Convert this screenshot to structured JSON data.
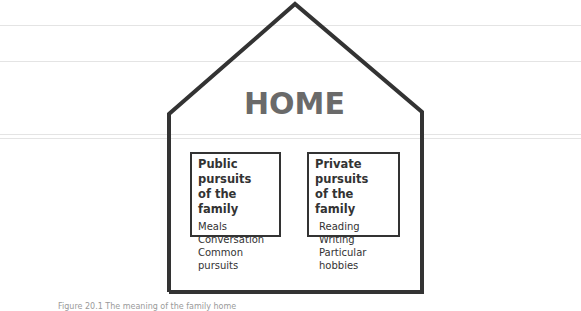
{
  "diagram": {
    "title": "HOME",
    "boxes": [
      {
        "heading_line1": "Public pursuits",
        "heading_line2": "of the family",
        "items": [
          "Meals",
          "Conversation",
          "Common pursuits"
        ]
      },
      {
        "heading_line1": "Private pursuits",
        "heading_line2": "of the family",
        "items": [
          "Reading",
          "Writing",
          "Particular hobbies"
        ]
      }
    ],
    "caption": "Figure 20.1  The meaning of the family home",
    "colors": {
      "outline": "#333333",
      "title": "#6a6a6a",
      "background": "#ffffff"
    }
  }
}
